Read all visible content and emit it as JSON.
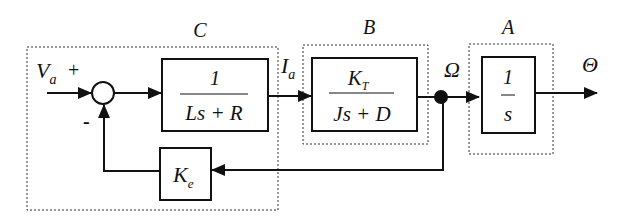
{
  "diagram": {
    "type": "block-diagram",
    "groups": {
      "C": {
        "label": "C"
      },
      "B": {
        "label": "B"
      },
      "A": {
        "label": "A"
      }
    },
    "signals": {
      "input": {
        "main": "V",
        "sub": "a"
      },
      "plus_sign": "+",
      "minus_sign": "-",
      "current": {
        "main": "I",
        "sub": "a"
      },
      "speed": "Ω",
      "output": "Θ"
    },
    "blocks": {
      "electrical": {
        "numerator": "1",
        "denominator": "Ls + R"
      },
      "mechanical": {
        "numerator_main": "K",
        "numerator_sub": "T",
        "denominator": "Js + D"
      },
      "integrator": {
        "numerator": "1",
        "denominator": "s"
      },
      "back_emf": {
        "main": "K",
        "sub": "e"
      }
    },
    "colors": {
      "line": "#111111",
      "dashed": "#333333",
      "background": "#ffffff"
    }
  }
}
